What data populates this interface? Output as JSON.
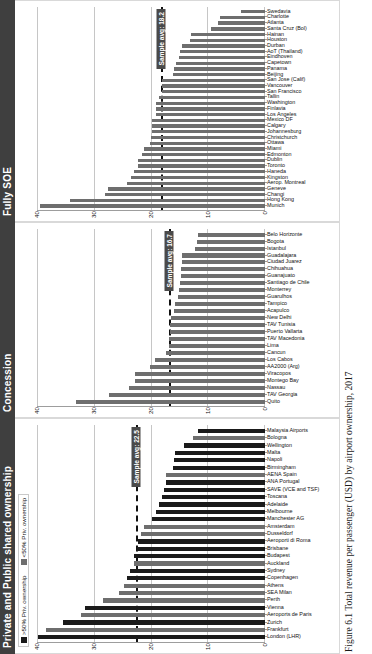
{
  "figure": {
    "caption": "Figure 6.1  Total revenue per passenger (USD) by airport ownership, 2017"
  },
  "legend": {
    "items": [
      {
        "label": ">50% Priv. ownership",
        "color": "#1a1a1a",
        "key": "black"
      },
      {
        "label": "<50% Priv. ownership",
        "color": "#6e6e6e",
        "key": "gray"
      }
    ]
  },
  "axis": {
    "ticks": [
      "0",
      "10",
      "20",
      "30",
      "40"
    ],
    "min": 0,
    "max": 40,
    "gridlines": [
      0,
      10,
      20,
      30,
      40
    ]
  },
  "panels": [
    {
      "id": "private",
      "title": "Private and Public shared ownership",
      "avg_label": "Sample avg: 22.5",
      "avg_value": 22.5
    },
    {
      "id": "concession",
      "title": "Concession",
      "avg_label": "Sample avg: 16.7",
      "avg_value": 16.7
    },
    {
      "id": "soe",
      "title": "Fully SOE",
      "avg_label": "Sample avg: 18.2",
      "avg_value": 18.2
    }
  ],
  "chart_data": [
    {
      "type": "bar",
      "panel_id": "private",
      "title": "Private and Public shared ownership",
      "xlabel": "",
      "ylabel": "Total revenue per passenger (USD)",
      "ylim": [
        0,
        40
      ],
      "grid": true,
      "legend_position": "top-left",
      "annotations": [
        {
          "type": "hline",
          "value": 22.5,
          "label": "Sample avg: 22.5",
          "style": "dashed"
        }
      ],
      "categories": [
        "London (LHR)",
        "Frankfurt",
        "Zurich",
        "Aeroports de Paris",
        "Vienna",
        "Perth",
        "SEA Milan",
        "Athens",
        "Copenhagen",
        "Sydney",
        "Auckland",
        "Budapest",
        "Brisbane",
        "Aeroporti di Roma",
        "Dusseldorf",
        "Amsterdam",
        "Manchester AG",
        "Melbourne",
        "Adelaide",
        "Toscana",
        "SAVE (VCE and TSF)",
        "ANA Portugal",
        "AENA Spain",
        "Birmingham",
        "Napoli",
        "Malta",
        "Wellington",
        "Bologna",
        "Malaysia Airports"
      ],
      "values": [
        39.8,
        38.5,
        35.5,
        32.2,
        31.6,
        28.4,
        25.6,
        24.7,
        24.2,
        23.6,
        23.0,
        23.0,
        22.4,
        22.2,
        21.7,
        21.2,
        19.9,
        19.2,
        18.6,
        18.1,
        17.8,
        17.4,
        17.3,
        16.2,
        15.9,
        15.8,
        14.3,
        12.6,
        11.7
      ],
      "series_color_keys": [
        "black",
        "gray",
        "black",
        "gray",
        "black",
        "gray",
        "gray",
        "gray",
        "black",
        "black",
        "gray",
        "black",
        "black",
        "black",
        "gray",
        "gray",
        "black",
        "black",
        "black",
        "black",
        "black",
        "black",
        "gray",
        "black",
        "black",
        "black",
        "black",
        "gray",
        "black"
      ]
    },
    {
      "type": "bar",
      "panel_id": "concession",
      "title": "Concession",
      "xlabel": "",
      "ylabel": "Total revenue per passenger (USD)",
      "ylim": [
        0,
        40
      ],
      "grid": true,
      "annotations": [
        {
          "type": "hline",
          "value": 16.7,
          "label": "Sample avg: 16.7",
          "style": "dashed"
        }
      ],
      "categories": [
        "Quito",
        "TAV Georgia",
        "Nassau",
        "Montego Bay",
        "Viracopos",
        "AA2000 (Arg)",
        "Los Cabos",
        "Cancun",
        "Lima",
        "TAV Macedonia",
        "Puerto Vallarta",
        "TAV Tunisia",
        "New Delhi",
        "Acapulco",
        "Tampico",
        "Guarulhos",
        "Monterrey",
        "Santiago de Chile",
        "Guanajuato",
        "Chihuahua",
        "Ciudad Juarez",
        "Guadalajara",
        "Istanbul",
        "Bogota",
        "Belo Horizonte"
      ],
      "values": [
        33.2,
        27.4,
        23.9,
        22.8,
        22.8,
        20.2,
        19.3,
        17.4,
        16.9,
        16.8,
        16.7,
        16.6,
        16.5,
        16.0,
        15.8,
        15.2,
        15.1,
        15.0,
        14.8,
        14.8,
        14.6,
        14.6,
        12.3,
        11.9,
        11.8
      ],
      "series_color_keys": [
        "gray",
        "gray",
        "gray",
        "gray",
        "gray",
        "gray",
        "gray",
        "gray",
        "gray",
        "gray",
        "gray",
        "gray",
        "gray",
        "gray",
        "gray",
        "gray",
        "gray",
        "gray",
        "gray",
        "gray",
        "gray",
        "gray",
        "gray",
        "gray",
        "gray"
      ]
    },
    {
      "type": "bar",
      "panel_id": "soe",
      "title": "Fully SOE",
      "xlabel": "",
      "ylabel": "Total revenue per passenger (USD)",
      "ylim": [
        0,
        40
      ],
      "grid": true,
      "annotations": [
        {
          "type": "hline",
          "value": 18.2,
          "label": "Sample avg: 18.2",
          "style": "dashed"
        }
      ],
      "categories": [
        "Munich",
        "Hong Kong",
        "Changi",
        "Geneve",
        "Aerop. Montreal",
        "Kingston",
        "Haneda",
        "Toronto",
        "Dublin",
        "Edmonton",
        "Miami",
        "Ottawa",
        "Christchurch",
        "Johannesburg",
        "Calgary",
        "Mexico DF",
        "Los Angeles",
        "Finlavia",
        "Washington",
        "Tallin",
        "San Francisco",
        "Vancouver",
        "San Jose (Calif)",
        "Beijing",
        "Panama",
        "Capetown",
        "Eindhoven",
        "AoT (Thailand)",
        "Durban",
        "Houston",
        "Hainan",
        "Santa Cruz (Bol)",
        "Atlanta",
        "Charlotte",
        "Swedavia"
      ],
      "values": [
        39.5,
        34.2,
        28.0,
        27.6,
        24.3,
        23.5,
        23.0,
        22.3,
        22.3,
        21.6,
        21.2,
        20.2,
        20.0,
        19.9,
        19.8,
        19.8,
        19.2,
        19.1,
        19.1,
        18.6,
        18.1,
        18.0,
        18.0,
        16.2,
        16.0,
        15.6,
        15.1,
        14.9,
        14.5,
        13.2,
        12.9,
        9.4,
        8.2,
        7.9,
        4.2
      ],
      "series_color_keys": [
        "gray",
        "gray",
        "gray",
        "gray",
        "gray",
        "gray",
        "gray",
        "gray",
        "gray",
        "gray",
        "gray",
        "gray",
        "gray",
        "gray",
        "gray",
        "gray",
        "gray",
        "gray",
        "gray",
        "gray",
        "gray",
        "gray",
        "gray",
        "gray",
        "gray",
        "gray",
        "gray",
        "gray",
        "gray",
        "gray",
        "gray",
        "gray",
        "gray",
        "gray",
        "gray"
      ]
    }
  ]
}
